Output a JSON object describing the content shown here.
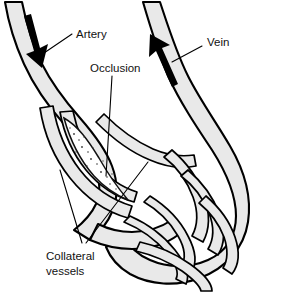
{
  "figure": {
    "background_color": "#ffffff",
    "vessel_fill_color": "#e9e9e9",
    "vessel_outline_color": "#000000",
    "arrow_color": "#000000",
    "label_color": "#111111"
  },
  "labels": {
    "artery": "Artery",
    "occlusion": "Occlusion",
    "vein": "Vein",
    "collateral_line1": "Collateral",
    "collateral_line2": "vessels"
  },
  "flow_markers": [
    {
      "name": "artery-flow-arrow",
      "vessel": "Artery",
      "direction": "downward",
      "meaning": "blood flowing away from the heart, down the limb"
    },
    {
      "name": "vein-flow-arrow",
      "vessel": "Vein",
      "direction": "upward",
      "meaning": "blood returning toward the heart"
    }
  ],
  "structures": [
    {
      "name": "artery-trunk",
      "label": "Artery",
      "side": "left",
      "description": "Large vessel descending from upper-left, carrying the downward flow arrow"
    },
    {
      "name": "occlusion-segment",
      "label": "Occlusion",
      "side": "center-left",
      "description": "Blocked, stippled segment of the artery bypassed by collaterals"
    },
    {
      "name": "collateral-vessels",
      "label": "Collateral vessels",
      "side": "left-and-center",
      "description": "Thin bypass channels routing blood around the occluded segment"
    },
    {
      "name": "vein-trunk",
      "label": "Vein",
      "side": "right",
      "description": "Large vessel ascending to upper-right, carrying the upward flow arrow"
    },
    {
      "name": "distal-vascular-network",
      "label": "",
      "side": "right-lower",
      "description": "Looping arcade of distal vessels connecting artery and vein"
    }
  ]
}
